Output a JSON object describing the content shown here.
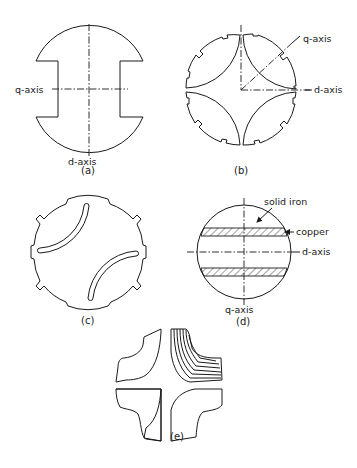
{
  "figure": {
    "panels": [
      {
        "id": "a",
        "caption": "(a)",
        "description": "Salient two-pole rotor cross-section",
        "labels": {
          "q_axis": "q-axis",
          "d_axis": "d-axis"
        }
      },
      {
        "id": "b",
        "caption": "(b)",
        "description": "Four-segment rotor with curved flux barriers",
        "labels": {
          "q_axis": "q-axis",
          "d_axis": "d-axis"
        }
      },
      {
        "id": "c",
        "caption": "(c)",
        "description": "Rotor with two curved slot barriers"
      },
      {
        "id": "d",
        "caption": "(d)",
        "description": "Solid iron rotor with copper bands",
        "labels": {
          "solid_iron": "solid iron",
          "copper": "copper",
          "d_axis": "d-axis",
          "q_axis": "q-axis"
        }
      },
      {
        "id": "e",
        "caption": "(e)",
        "description": "Axially laminated rotor segments"
      }
    ]
  }
}
